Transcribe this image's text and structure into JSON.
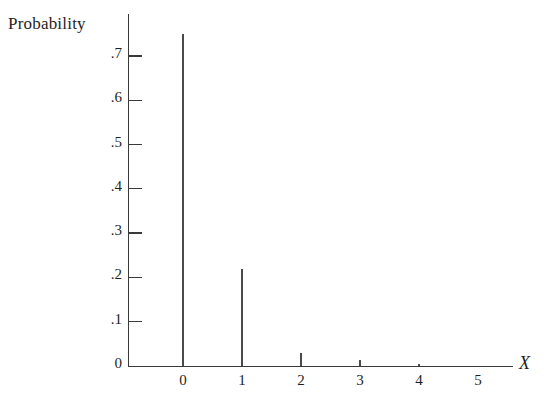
{
  "chart_data": {
    "type": "bar",
    "title": "",
    "subtitle": "",
    "xlabel": "X",
    "ylabel": "Probability",
    "categories": [
      0,
      1,
      2,
      3,
      4,
      5
    ],
    "values": [
      0.75,
      0.22,
      0.03,
      0.013,
      0.005,
      0.0
    ],
    "x_tick_labels": [
      "0",
      "1",
      "2",
      "3",
      "4",
      "5"
    ],
    "y_tick_labels": [
      "0",
      ".1",
      ".2",
      ".3",
      ".4",
      ".5",
      ".6",
      ".7"
    ],
    "y_tick_values": [
      0,
      0.1,
      0.2,
      0.3,
      0.4,
      0.5,
      0.6,
      0.7
    ],
    "xlim": [
      -0.9,
      6.4
    ],
    "ylim": [
      0,
      0.8
    ],
    "grid": false,
    "legend": null,
    "annotations": [],
    "series": [
      {
        "name": "Probability",
        "values": [
          0.75,
          0.22,
          0.03,
          0.013,
          0.005,
          0.0
        ]
      }
    ]
  },
  "style": {
    "axis_color": "#3a3a3a",
    "spike_color": "#4a4a4a",
    "text_color": "#1f1f1f",
    "background": "#ffffff"
  }
}
